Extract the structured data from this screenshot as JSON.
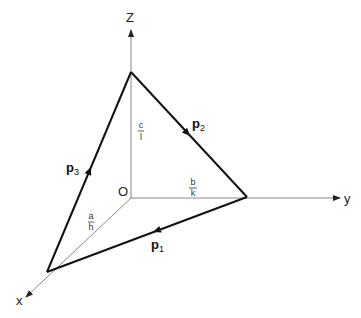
{
  "diagram": {
    "type": "3d-coordinate-plane-intercepts",
    "axes": {
      "z_label": "Z",
      "y_label": "y",
      "x_label": "x",
      "origin_label": "O"
    },
    "intercepts": {
      "z": {
        "num": "c",
        "den": "l"
      },
      "y": {
        "num": "b",
        "den": "k"
      },
      "x": {
        "num": "a",
        "den": "h"
      }
    },
    "vectors": [
      {
        "name": "p",
        "sub": "1",
        "from": "y-intercept",
        "to": "x-intercept"
      },
      {
        "name": "p",
        "sub": "2",
        "from": "z-intercept",
        "to": "y-intercept"
      },
      {
        "name": "p",
        "sub": "3",
        "from": "x-intercept",
        "to": "z-intercept"
      }
    ],
    "colors": {
      "axis": "#888888",
      "triangle": "#111111",
      "text": "#222222"
    }
  }
}
